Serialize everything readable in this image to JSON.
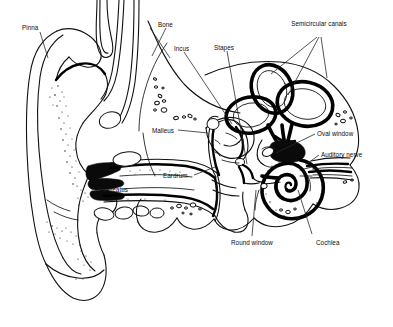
{
  "figure": {
    "background_color": "#ffffff",
    "ink_color": "#101010",
    "width": 393,
    "height": 327
  },
  "labels": [
    {
      "key": "pinna",
      "text": "Pinna",
      "x": 22,
      "y": 24,
      "lines": 1
    },
    {
      "key": "bone",
      "text": "Bone",
      "x": 158,
      "y": 21,
      "lines": 1
    },
    {
      "key": "incus",
      "text": "Incus",
      "x": 174,
      "y": 45,
      "lines": 1
    },
    {
      "key": "stapes",
      "text": "Stapes",
      "x": 214,
      "y": 44,
      "lines": 1
    },
    {
      "key": "semicircular_canals",
      "text": "Semicircular canals",
      "x": 290,
      "y": 20,
      "lines": 2
    },
    {
      "key": "malleus",
      "text": "Malleus",
      "x": 152,
      "y": 127,
      "lines": 1
    },
    {
      "key": "oval_window",
      "text": "Oval window",
      "x": 317,
      "y": 130,
      "lines": 1
    },
    {
      "key": "auditory_nerve",
      "text": "Auditory nerve",
      "x": 321,
      "y": 151,
      "lines": 1
    },
    {
      "key": "eardrum",
      "text": "Eardrum",
      "x": 163,
      "y": 172,
      "lines": 1
    },
    {
      "key": "meatus",
      "text": "Meatus",
      "x": 107,
      "y": 186,
      "lines": 1
    },
    {
      "key": "round_window",
      "text": "Round window",
      "x": 231,
      "y": 239,
      "lines": 1
    },
    {
      "key": "cochlea",
      "text": "Cochlea",
      "x": 316,
      "y": 239,
      "lines": 1
    }
  ],
  "structures": [
    {
      "key": "pinna",
      "name": "Pinna (auricle)",
      "region": "outer-ear"
    },
    {
      "key": "meatus",
      "name": "External auditory meatus",
      "region": "outer-ear"
    },
    {
      "key": "eardrum",
      "name": "Eardrum (tympanic membrane)",
      "region": "outer-ear"
    },
    {
      "key": "malleus",
      "name": "Malleus",
      "region": "middle-ear"
    },
    {
      "key": "incus",
      "name": "Incus",
      "region": "middle-ear"
    },
    {
      "key": "stapes",
      "name": "Stapes",
      "region": "middle-ear"
    },
    {
      "key": "oval_window",
      "name": "Oval window",
      "region": "middle-ear"
    },
    {
      "key": "round_window",
      "name": "Round window",
      "region": "middle-ear"
    },
    {
      "key": "semicircular_canals",
      "name": "Semicircular canals",
      "region": "inner-ear"
    },
    {
      "key": "cochlea",
      "name": "Cochlea",
      "region": "inner-ear"
    },
    {
      "key": "auditory_nerve",
      "name": "Auditory nerve",
      "region": "inner-ear"
    },
    {
      "key": "bone",
      "name": "Bone (temporal bone)",
      "region": "skull"
    }
  ]
}
